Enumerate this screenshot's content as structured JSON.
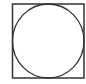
{
  "diagram": {
    "shapes": [
      {
        "type": "square",
        "x": 12.5,
        "y": 4,
        "width": 71.5,
        "height": 74,
        "stroke": "#333333",
        "stroke_width": 1.5
      },
      {
        "type": "circle",
        "cx": 48.25,
        "cy": 41,
        "rx": 35.75,
        "ry": 37,
        "stroke": "#333333",
        "stroke_width": 1.3
      }
    ],
    "stroke_color": "#333333",
    "background": "#ffffff"
  }
}
